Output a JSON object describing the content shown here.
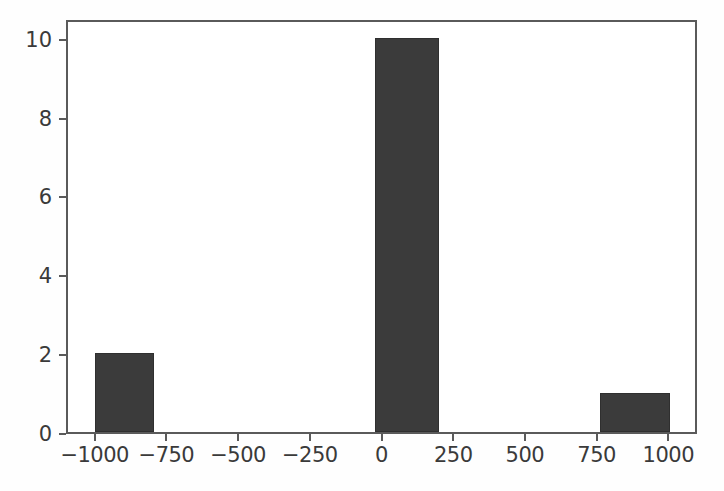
{
  "chart_data": {
    "type": "bar",
    "title": "",
    "subtitle": "",
    "xlabel": "",
    "ylabel": "",
    "grid": false,
    "legend": null,
    "xlim": [
      -1100,
      1100
    ],
    "ylim": [
      0,
      10.5
    ],
    "xticks": [
      -1000,
      -750,
      -500,
      -250,
      0,
      250,
      500,
      750,
      1000
    ],
    "xtick_labels": [
      "−1000",
      "−750",
      "−500",
      "−250",
      "0",
      "250",
      "500",
      "750",
      "1000"
    ],
    "yticks": [
      0,
      2,
      4,
      6,
      8,
      10
    ],
    "ytick_labels": [
      "0",
      "2",
      "4",
      "6",
      "8",
      "10"
    ],
    "bar_color": "#3b3b3b",
    "bar_edge_color": "#2f2f2f",
    "axis_color": "#5a5a5a",
    "background_color": "#ffffff",
    "bars": [
      {
        "name": "bar-left",
        "x_start": -1005,
        "x_end": -800,
        "value": 2
      },
      {
        "name": "bar-center",
        "x_start": -30,
        "x_end": 195,
        "value": 10
      },
      {
        "name": "bar-right",
        "x_start": 755,
        "x_end": 1000,
        "value": 1
      }
    ],
    "categories": [
      "−900",
      "80",
      "880"
    ],
    "values": [
      2,
      10,
      1
    ]
  }
}
